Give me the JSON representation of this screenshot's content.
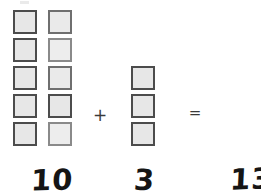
{
  "worksheet": {
    "title": "Addition with square manipulatives",
    "background_color": "#ffffff",
    "block_fill_color": "#e7e7e7",
    "block_border_color": "#4c4c4c",
    "ink_color": "#151515"
  },
  "equation": {
    "plus_symbol": "+",
    "equals_symbol": "=",
    "left_addend": "10",
    "right_addend": "3",
    "sum": "13"
  },
  "groups": {
    "left": {
      "name": "ten-group",
      "count": 10,
      "columns": 2,
      "rows": 5,
      "label": "10"
    },
    "right": {
      "name": "three-group",
      "count": 3,
      "columns": 1,
      "rows": 3,
      "label": "3"
    }
  },
  "blocks": {
    "left": [
      {
        "col": 1,
        "row": 1
      },
      {
        "col": 2,
        "row": 1
      },
      {
        "col": 1,
        "row": 2
      },
      {
        "col": 2,
        "row": 2
      },
      {
        "col": 1,
        "row": 3
      },
      {
        "col": 2,
        "row": 3
      },
      {
        "col": 1,
        "row": 4
      },
      {
        "col": 2,
        "row": 4
      },
      {
        "col": 1,
        "row": 5
      },
      {
        "col": 2,
        "row": 5
      }
    ],
    "right": [
      {
        "col": 1,
        "row": 3
      },
      {
        "col": 1,
        "row": 4
      },
      {
        "col": 1,
        "row": 5
      }
    ]
  }
}
